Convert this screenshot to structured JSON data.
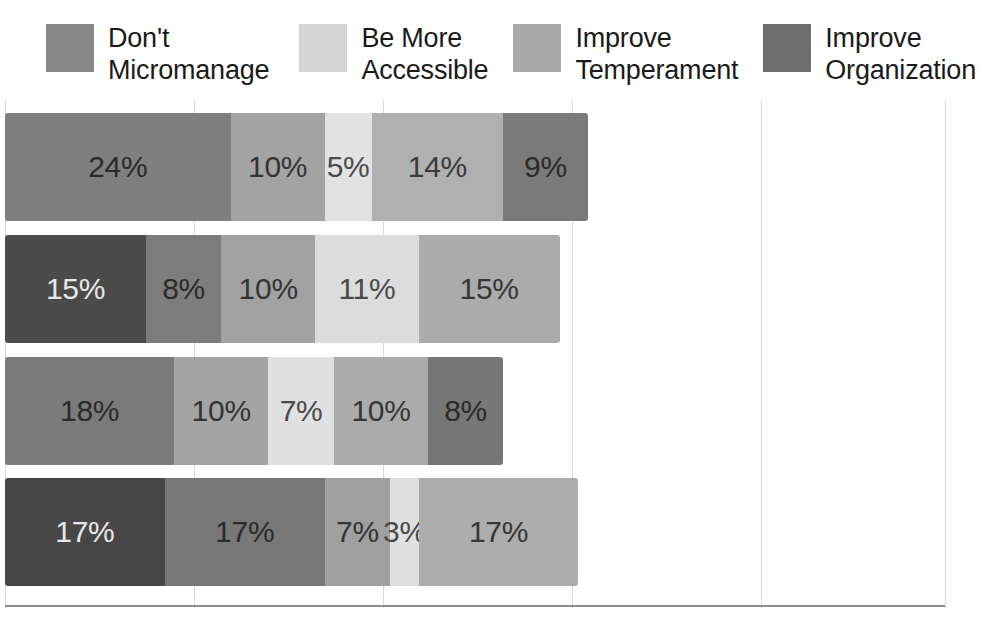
{
  "legend": {
    "items": [
      {
        "label": "Don't\nMicromanage",
        "color": "#878787",
        "name": "dont-micromanage"
      },
      {
        "label": "Be More\nAccessible",
        "color": "#d6d6d6",
        "name": "be-more-accessible"
      },
      {
        "label": "Improve\nTemperament",
        "color": "#a9a9a9",
        "name": "improve-temperament"
      },
      {
        "label": "Improve\nOrganization",
        "color": "#6e6e6e",
        "name": "improve-organization"
      }
    ]
  },
  "chart_data": {
    "type": "bar",
    "title": "",
    "subtitle": "",
    "xlabel": "",
    "ylabel": "",
    "orientation": "horizontal",
    "stacked": true,
    "grid": true,
    "legend_position": "top",
    "xlim": [
      0,
      100
    ],
    "xticks": [
      0,
      20,
      40,
      60,
      80,
      100
    ],
    "categories": [
      "Row 1",
      "Row 2",
      "Row 3",
      "Row 4"
    ],
    "series": [
      {
        "name": "Don't Micromanage",
        "color": "#878787",
        "values": [
          24,
          15,
          18,
          17
        ]
      },
      {
        "name": "Be More Accessible",
        "color": "#d6d6d6",
        "values": [
          5,
          11,
          7,
          3
        ]
      },
      {
        "name": "Improve Temperament",
        "color": "#a9a9a9",
        "values": [
          14,
          15,
          10,
          17
        ]
      },
      {
        "name": "Improve Organization",
        "color": "#6e6e6e",
        "values": [
          9,
          8,
          8,
          17
        ]
      }
    ],
    "rows": [
      {
        "name": "row-1",
        "segments": [
          {
            "label": "24%",
            "value": 24,
            "color": "#7f7f7f",
            "text_color": "#2b2b2b"
          },
          {
            "label": "10%",
            "value": 10,
            "color": "#a3a3a3",
            "text_color": "#343434"
          },
          {
            "label": "5%",
            "value": 5,
            "color": "#e2e2e2",
            "text_color": "#4a4a4a"
          },
          {
            "label": "14%",
            "value": 14,
            "color": "#b0b0b0",
            "text_color": "#3a3a3a"
          },
          {
            "label": "9%",
            "value": 9,
            "color": "#7a7a7a",
            "text_color": "#2b2b2b"
          }
        ]
      },
      {
        "name": "row-2",
        "segments": [
          {
            "label": "15%",
            "value": 15,
            "color": "#4b4b4b",
            "text_color": "#e8e8e8"
          },
          {
            "label": "8%",
            "value": 8,
            "color": "#7d7d7d",
            "text_color": "#2b2b2b"
          },
          {
            "label": "10%",
            "value": 10,
            "color": "#a2a2a2",
            "text_color": "#343434"
          },
          {
            "label": "11%",
            "value": 11,
            "color": "#dcdcdc",
            "text_color": "#4a4a4a"
          },
          {
            "label": "15%",
            "value": 15,
            "color": "#ababab",
            "text_color": "#363636"
          }
        ]
      },
      {
        "name": "row-3",
        "segments": [
          {
            "label": "18%",
            "value": 18,
            "color": "#7b7b7b",
            "text_color": "#2b2b2b"
          },
          {
            "label": "10%",
            "value": 10,
            "color": "#a4a4a4",
            "text_color": "#343434"
          },
          {
            "label": "7%",
            "value": 7,
            "color": "#e0e0e0",
            "text_color": "#4a4a4a"
          },
          {
            "label": "10%",
            "value": 10,
            "color": "#ababab",
            "text_color": "#363636"
          },
          {
            "label": "8%",
            "value": 8,
            "color": "#777777",
            "text_color": "#2b2b2b"
          }
        ]
      },
      {
        "name": "row-4",
        "segments": [
          {
            "label": "17%",
            "value": 17,
            "color": "#474747",
            "text_color": "#e8e8e8"
          },
          {
            "label": "17%",
            "value": 17,
            "color": "#787878",
            "text_color": "#2b2b2b"
          },
          {
            "label": "7%",
            "value": 7,
            "color": "#a0a0a0",
            "text_color": "#343434"
          },
          {
            "label": "3%",
            "value": 3,
            "color": "#e0e0e0",
            "text_color": "#4a4a4a"
          },
          {
            "label": "17%",
            "value": 17,
            "color": "#adadad",
            "text_color": "#363636"
          }
        ]
      }
    ],
    "gridline_positions": [
      5,
      194,
      383,
      572,
      761,
      945
    ]
  }
}
